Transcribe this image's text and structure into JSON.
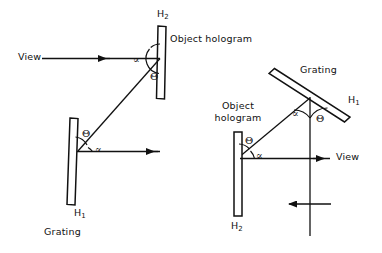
{
  "figure": {
    "ink_color": "#111111",
    "background": "#ffffff"
  },
  "panels": [
    {
      "id": "left",
      "name": "left-setup",
      "elements": {
        "top_plate_label": "H2",
        "top_plate_name": "Object hologram",
        "bottom_plate_label": "H1",
        "bottom_plate_name": "Grating",
        "view_label": "View",
        "angle_alpha_top": "∝",
        "angle_theta_top": "Θ",
        "angle_theta_bottom": "Θ",
        "angle_alpha_bottom": "∝"
      }
    },
    {
      "id": "right",
      "name": "right-setup",
      "elements": {
        "top_plate_label": "H1",
        "top_plate_name": "Grating",
        "bottom_plate_label": "H2",
        "bottom_plate_name_line1": "Object",
        "bottom_plate_name_line2": "hologram",
        "view_label": "View",
        "angle_alpha_top": "∝",
        "angle_theta_top": "Θ",
        "angle_theta_bottom": "Θ",
        "angle_alpha_bottom": "∝"
      }
    }
  ],
  "symbols": {
    "alpha": "∝",
    "theta": "Θ",
    "h_one": "H1",
    "h_two": "H2"
  }
}
